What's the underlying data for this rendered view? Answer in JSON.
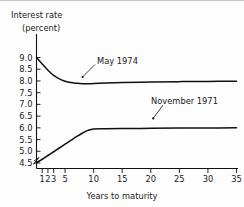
{
  "chart_data": {
    "type": "line",
    "title": "",
    "ylabel_line1": "Interest rate",
    "ylabel_line2": "(percent)",
    "xlabel": "Years to maturity",
    "xlim": [
      0,
      35
    ],
    "ylim": [
      4.5,
      9.0
    ],
    "grid": false,
    "legend_position": "inline-annotation",
    "axis_break": "y-axis base break (zigzag)",
    "x_ticks": [
      1,
      2,
      3,
      5,
      10,
      15,
      20,
      25,
      30,
      35
    ],
    "x_tick_labels": [
      "1",
      "2",
      "3",
      "5",
      "10",
      "15",
      "20",
      "25",
      "30",
      "35"
    ],
    "y_ticks": [
      4.5,
      5.0,
      5.5,
      6.0,
      6.5,
      7.0,
      7.5,
      8.0,
      8.5,
      9.0
    ],
    "y_tick_labels": [
      "4.5",
      "5.0",
      "5.5",
      "6.0",
      "6.5",
      "7.0",
      "7.5",
      "8.0",
      "8.5",
      "9.0"
    ],
    "series": [
      {
        "name": "May 1974",
        "color": "#101010",
        "x": [
          0,
          1,
          2,
          3,
          4,
          5,
          6,
          7,
          8,
          9,
          10,
          12,
          15,
          20,
          25,
          30,
          35
        ],
        "values": [
          9.0,
          8.72,
          8.46,
          8.24,
          8.09,
          7.99,
          7.93,
          7.9,
          7.88,
          7.88,
          7.89,
          7.91,
          7.93,
          7.95,
          7.97,
          7.98,
          7.99
        ]
      },
      {
        "name": "November 1971",
        "color": "#101010",
        "x": [
          0,
          1,
          2,
          3,
          4,
          5,
          6,
          7,
          8,
          9,
          10,
          12,
          15,
          20,
          25,
          30,
          35
        ],
        "values": [
          4.5,
          4.66,
          4.82,
          4.98,
          5.14,
          5.3,
          5.46,
          5.62,
          5.77,
          5.89,
          5.95,
          5.96,
          5.97,
          5.98,
          5.99,
          5.99,
          6.0
        ]
      }
    ],
    "annotations": [
      {
        "text": "May 1974",
        "attached_series": "May 1974",
        "pointer_at_x": 4.2,
        "pointer_at_y": 8.07
      },
      {
        "text": "November 1971",
        "attached_series": "November 1971",
        "pointer_at_x": 20.0,
        "pointer_at_y": 5.98
      }
    ]
  }
}
